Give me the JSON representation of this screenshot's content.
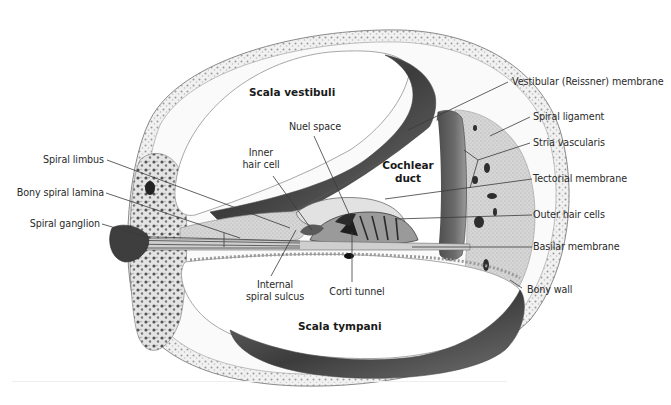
{
  "figure": {
    "regions": {
      "scala_vestibuli": "Scala vestibuli",
      "cochlear_duct_line1": "Cochlear",
      "cochlear_duct_line2": "duct",
      "scala_tympani": "Scala tympani"
    },
    "labels_left": [
      {
        "id": "spiral-limbus",
        "text": "Spiral limbus"
      },
      {
        "id": "bony-spiral-lamina",
        "text": "Bony spiral lamina"
      },
      {
        "id": "spiral-ganglion",
        "text": "Spiral ganglion"
      }
    ],
    "labels_center": {
      "inner_hair_cell_line1": "Inner",
      "inner_hair_cell_line2": "hair cell",
      "nuel_space": "Nuel space",
      "internal_spiral_sulcus_line1": "Internal",
      "internal_spiral_sulcus_line2": "spiral sulcus",
      "corti_tunnel": "Corti tunnel"
    },
    "labels_right": [
      {
        "id": "vestibular-membrane",
        "text": "Vestibular (Reissner) membrane"
      },
      {
        "id": "spiral-ligament",
        "text": "Spiral ligament"
      },
      {
        "id": "stria-vascularis",
        "text": "Stria vascularis"
      },
      {
        "id": "tectorial-membrane",
        "text": "Tectorial membrane"
      },
      {
        "id": "outer-hair-cells",
        "text": "Outer hair cells"
      },
      {
        "id": "basilar-membrane",
        "text": "Basilar membrane"
      },
      {
        "id": "bony-wall",
        "text": "Bony wall"
      }
    ],
    "colors": {
      "background": "#ffffff",
      "label_text": "#2a2a2a",
      "leader_line": "#3a3a3a",
      "bone": "#d9d9d9",
      "dark_tissue": "#4a4a4a",
      "mid_tissue": "#8c8c8c",
      "light_tissue": "#c8c8c8"
    }
  }
}
